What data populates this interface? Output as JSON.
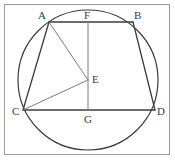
{
  "figure": {
    "canvas": {
      "width": 175,
      "height": 162,
      "background": "#ffffff"
    },
    "border": {
      "name": "figure-border",
      "x": 4.5,
      "y": 4.5,
      "width": 165,
      "height": 150,
      "stroke": "#9a9a9a",
      "stroke_width": 1
    },
    "circle": {
      "name": "circumscribed-circle",
      "cx": 88,
      "cy": 80,
      "r": 70,
      "stroke": "#3c3c3c",
      "stroke_width": 1.2,
      "fill": "none"
    },
    "points": [
      {
        "id": "A",
        "label": "A",
        "x": 49,
        "y": 22,
        "label_x": 38,
        "label_y": 10
      },
      {
        "id": "B",
        "label": "B",
        "x": 133,
        "y": 22,
        "label_x": 134,
        "label_y": 10
      },
      {
        "id": "C",
        "label": "C",
        "x": 23,
        "y": 110,
        "label_x": 12,
        "label_y": 106
      },
      {
        "id": "D",
        "label": "D",
        "x": 155,
        "y": 110,
        "label_x": 157,
        "label_y": 106
      },
      {
        "id": "E",
        "label": "E",
        "x": 88,
        "y": 80,
        "label_x": 92,
        "label_y": 74
      },
      {
        "id": "F",
        "label": "F",
        "x": 88,
        "y": 22,
        "label_x": 84,
        "label_y": 10
      },
      {
        "id": "G",
        "label": "G",
        "x": 88,
        "y": 110,
        "label_x": 84,
        "label_y": 114
      }
    ],
    "segments": [
      {
        "name": "segment-AB",
        "from": "A",
        "to": "B",
        "x1": 49,
        "y1": 22,
        "x2": 133,
        "y2": 22,
        "stroke": "#3c3c3c",
        "stroke_width": 1.3
      },
      {
        "name": "segment-CD",
        "from": "C",
        "to": "D",
        "x1": 23,
        "y1": 110,
        "x2": 155,
        "y2": 110,
        "stroke": "#3c3c3c",
        "stroke_width": 1.3
      },
      {
        "name": "segment-AC",
        "from": "A",
        "to": "C",
        "x1": 49,
        "y1": 22,
        "x2": 23,
        "y2": 110,
        "stroke": "#3c3c3c",
        "stroke_width": 1.3
      },
      {
        "name": "segment-BD",
        "from": "B",
        "to": "D",
        "x1": 133,
        "y1": 22,
        "x2": 155,
        "y2": 110,
        "stroke": "#3c3c3c",
        "stroke_width": 1.3
      },
      {
        "name": "segment-FG",
        "from": "F",
        "to": "G",
        "x1": 88,
        "y1": 22,
        "x2": 88,
        "y2": 110,
        "stroke": "#7d7d7d",
        "stroke_width": 1
      },
      {
        "name": "segment-AE",
        "from": "A",
        "to": "E",
        "x1": 49,
        "y1": 22,
        "x2": 88,
        "y2": 80,
        "stroke": "#7d7d7d",
        "stroke_width": 1
      },
      {
        "name": "segment-CE",
        "from": "C",
        "to": "E",
        "x1": 23,
        "y1": 110,
        "x2": 88,
        "y2": 80,
        "stroke": "#7d7d7d",
        "stroke_width": 1
      }
    ]
  }
}
